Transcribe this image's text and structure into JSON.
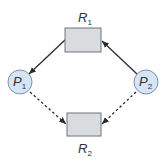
{
  "diagram": {
    "type": "resource-allocation-graph",
    "colors": {
      "resource_fill": "#d9dcdf",
      "resource_stroke": "#6f7378",
      "process_fill": "#d6e4f3",
      "process_stroke": "#7b93ad",
      "edge": "#2b2b2b",
      "text": "#333333"
    },
    "resources": [
      {
        "id": "R1",
        "label": "R",
        "subscript": "1"
      },
      {
        "id": "R2",
        "label": "R",
        "subscript": "2"
      }
    ],
    "processes": [
      {
        "id": "P1",
        "label": "P",
        "subscript": "1"
      },
      {
        "id": "P2",
        "label": "P",
        "subscript": "2"
      }
    ],
    "edges": [
      {
        "from": "R1",
        "to": "P1",
        "style": "solid",
        "kind": "assignment"
      },
      {
        "from": "P2",
        "to": "R1",
        "style": "solid",
        "kind": "request"
      },
      {
        "from": "P1",
        "to": "R2",
        "style": "dashed",
        "kind": "claim"
      },
      {
        "from": "P2",
        "to": "R2",
        "style": "dashed",
        "kind": "claim"
      }
    ]
  }
}
